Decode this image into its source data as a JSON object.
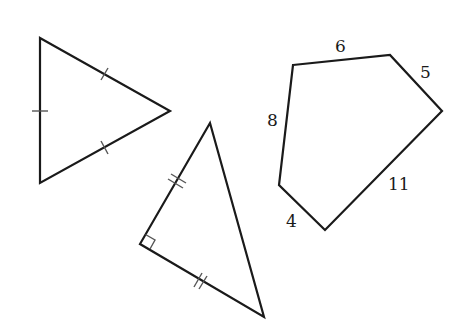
{
  "figure": {
    "width": 461,
    "height": 335,
    "background": "#ffffff",
    "stroke_color": "#1a1a1a"
  },
  "shapes": [
    {
      "name": "equilateral-triangle",
      "type": "triangle",
      "vertices": [
        [
          40,
          38
        ],
        [
          170,
          111
        ],
        [
          40,
          183
        ]
      ],
      "tick_marks": "single tick on each side (all sides equal)"
    },
    {
      "name": "isosceles-right-triangle",
      "type": "triangle",
      "vertices": [
        [
          210,
          123
        ],
        [
          140,
          244
        ],
        [
          264,
          317
        ]
      ],
      "right_angle_at": [
        140,
        244
      ],
      "tick_marks": "double ticks on the two legs (legs equal)"
    },
    {
      "name": "pentagon",
      "type": "pentagon",
      "vertices": [
        [
          293,
          65
        ],
        [
          390,
          55
        ],
        [
          442,
          111
        ],
        [
          325,
          230
        ],
        [
          279,
          185
        ]
      ],
      "side_labels": [
        {
          "text": "6",
          "x": 341,
          "y": 52
        },
        {
          "text": "5",
          "x": 426,
          "y": 78
        },
        {
          "text": "11",
          "x": 398,
          "y": 190
        },
        {
          "text": "4",
          "x": 292,
          "y": 227
        },
        {
          "text": "8",
          "x": 273,
          "y": 126
        }
      ]
    }
  ]
}
